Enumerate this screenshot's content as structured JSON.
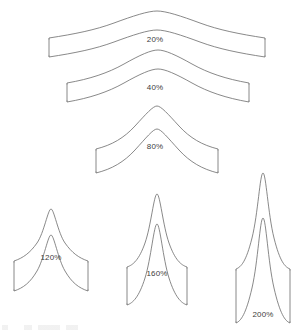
{
  "figure": {
    "title": "",
    "background_color": "#ffffff",
    "stroke_color": "#6b6b6b",
    "label_color": "#3d3d3d",
    "width": 292,
    "height": 331
  },
  "chart_data": {
    "type": "line",
    "title": "",
    "subtitle": "",
    "xlabel": "",
    "ylabel": "",
    "grid": false,
    "legend_position": "inline-labels",
    "categories": [
      "20%",
      "40%",
      "80%",
      "120%",
      "160%",
      "200%"
    ],
    "values": [
      20,
      40,
      80,
      120,
      160,
      200
    ],
    "series": [
      {
        "name": "deformation",
        "values": [
          20,
          40,
          80,
          120,
          160,
          200
        ]
      }
    ],
    "annotations": [
      "20%",
      "40%",
      "80%",
      "120%",
      "160%",
      "200%"
    ]
  },
  "shapes": [
    {
      "id": "band-20",
      "label": "20%",
      "value": 20,
      "label_x": 155,
      "label_y": 40,
      "outer_path": "M 49,39 L 49,38 C 75,34 95,30 114,23 C 133,16 148,11 157,11 C 166,11 181,16 200,23 C 219,30 239,34 265,38 L 265,39",
      "inner_path": "M 265,56 L 265,57 C 239,53 219,49 200,42 C 181,35 166,30 157,30 C 148,30 133,35 114,42 C 95,49 75,53 49,57 L 49,56",
      "cap_left": "M 49,39 L 49,56",
      "cap_right": "M 265,39 L 265,56"
    },
    {
      "id": "band-40",
      "label": "40%",
      "value": 40,
      "label_x": 155,
      "label_y": 88,
      "outer_path": "M 67,84 L 67,83 C 90,79 108,73 124,64 C 140,55 151,50 158,50 C 165,50 176,55 192,64 C 208,73 226,79 249,83 L 249,84",
      "inner_path": "M 249,101 L 249,102 C 226,98 208,92 192,83 C 176,74 165,69 158,69 C 151,69 140,74 124,83 C 108,92 90,98 67,102 L 67,101",
      "cap_left": "M 67,84 L 67,101",
      "cap_right": "M 249,84 L 249,101"
    },
    {
      "id": "band-80",
      "label": "80%",
      "value": 80,
      "label_x": 155,
      "label_y": 147,
      "outer_path": "M 96,150 L 96,149 C 112,145 124,138 135,126 C 146,114 153,106 157,106 C 161,106 168,114 179,126 C 190,138 202,145 218,149 L 218,150",
      "inner_path": "M 218,172 L 218,173 C 202,169 190,162 179,150 C 168,138 161,129 157,129 C 153,129 146,138 135,150 C 124,162 112,169 96,173 L 96,172",
      "cap_left": "M 96,150 L 96,172",
      "cap_right": "M 218,150 L 218,172"
    },
    {
      "id": "band-120",
      "label": "120%",
      "value": 120,
      "label_x": 51,
      "label_y": 258,
      "outer_path": "M 14,262 L 14,261 C 23,258 30,253 37,243 C 44,233 48,209 51,209 C 54,209 58,233 65,243 C 72,253 79,258 88,261 L 88,262",
      "inner_path": "M 88,290 L 88,291 C 79,288 72,283 65,271 C 58,259 54,235 51,235 C 48,235 44,259 37,271 C 30,283 23,288 14,291 L 14,290",
      "cap_left": "M 14,262 L 14,290",
      "cap_right": "M 88,262 L 88,290"
    },
    {
      "id": "band-160",
      "label": "160%",
      "value": 160,
      "label_x": 157,
      "label_y": 274,
      "outer_path": "M 127,268 L 127,267 C 133,265 139,260 145,243 C 151,226 154,194 157,194 C 160,194 163,226 169,243 C 175,260 181,265 187,267 L 187,268",
      "inner_path": "M 187,304 L 187,305 C 181,303 175,297 169,278 C 163,259 160,224 157,224 C 154,224 151,259 145,278 C 139,297 133,303 127,305 L 127,304",
      "cap_left": "M 127,268 L 127,304",
      "cap_right": "M 187,268 L 187,304"
    },
    {
      "id": "band-200",
      "label": "200%",
      "value": 200,
      "label_x": 263,
      "label_y": 315,
      "outer_path": "M 236,270 L 236,269 C 241,267 246,262 252,238 C 258,214 260,173 263,173 C 266,173 268,214 274,238 C 280,262 285,267 290,269 L 290,270",
      "inner_path": "M 290,322 L 290,323 C 285,321 280,314 274,288 C 268,262 266,218 263,218 C 260,218 258,262 252,288 C 246,314 241,321 236,323 L 236,322",
      "cap_left": "M 236,270 L 236,322",
      "cap_right": "M 290,270 L 290,322"
    }
  ]
}
